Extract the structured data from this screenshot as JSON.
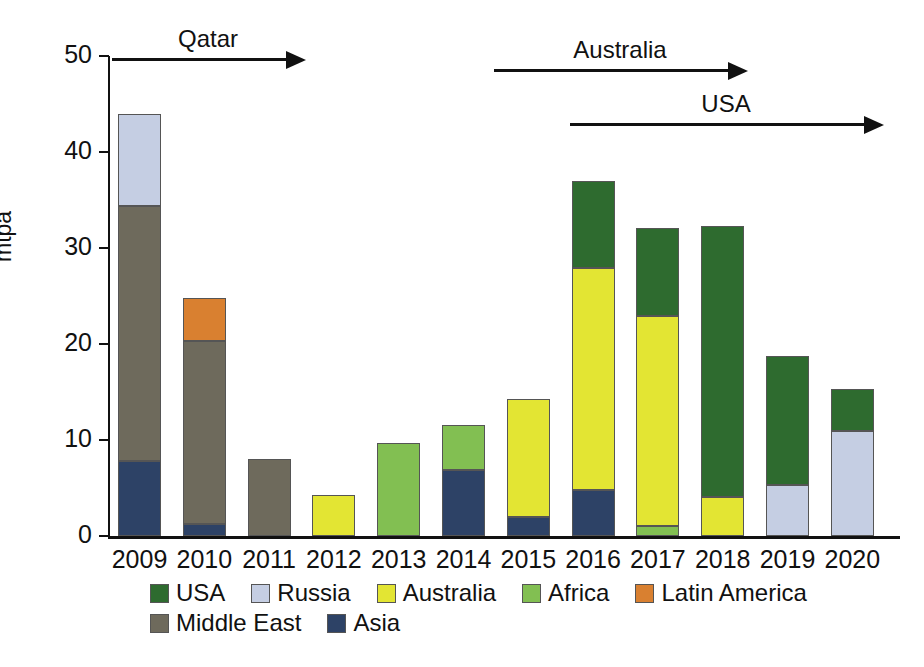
{
  "chart_data": {
    "type": "bar",
    "stacked": true,
    "title": "",
    "xlabel": "",
    "ylabel": "mtpa",
    "ylim": [
      0,
      50
    ],
    "yticks": [
      0,
      10,
      20,
      30,
      40,
      50
    ],
    "grid": false,
    "legend_position": "bottom",
    "categories": [
      "2009",
      "2010",
      "2011",
      "2012",
      "2013",
      "2014",
      "2015",
      "2016",
      "2017",
      "2018",
      "2019",
      "2020"
    ],
    "series": [
      {
        "name": "USA",
        "color": "#2e6b2f",
        "values": [
          0,
          0,
          0,
          0,
          0,
          0,
          0,
          9.1,
          9.2,
          28.2,
          13.4,
          4.4
        ]
      },
      {
        "name": "Russia",
        "color": "#c5cee3",
        "values": [
          9.6,
          0,
          0,
          0,
          0,
          0,
          0,
          0,
          0,
          0,
          5.3,
          10.9
        ]
      },
      {
        "name": "Australia",
        "color": "#e3e533",
        "values": [
          0,
          0,
          0,
          4.3,
          0,
          0,
          12.3,
          23.1,
          21.9,
          4.1,
          0,
          0
        ]
      },
      {
        "name": "Africa",
        "color": "#82bf52",
        "values": [
          0,
          0,
          0,
          0,
          9.7,
          4.7,
          0,
          0,
          1.0,
          0,
          0,
          0
        ]
      },
      {
        "name": "Latin America",
        "color": "#d98030",
        "values": [
          0,
          4.5,
          0,
          0,
          0,
          0,
          0,
          0,
          0,
          0,
          0,
          0
        ]
      },
      {
        "name": "Middle East",
        "color": "#6e6a5c",
        "values": [
          26.6,
          19.0,
          8.0,
          0,
          0,
          0,
          0,
          0,
          0,
          0,
          0,
          0
        ]
      },
      {
        "name": "Asia",
        "color": "#2d4266",
        "values": [
          7.8,
          1.3,
          0,
          0,
          0,
          6.9,
          2.0,
          4.8,
          0,
          0,
          0,
          0
        ]
      }
    ],
    "stack_order": [
      "Asia",
      "Middle East",
      "Latin America",
      "Africa",
      "Australia",
      "Russia",
      "USA"
    ],
    "totals": [
      44.0,
      24.8,
      8.0,
      4.3,
      9.7,
      11.6,
      14.3,
      37.0,
      32.1,
      32.3,
      18.7,
      15.3
    ],
    "annotations": [
      {
        "label": "Qatar",
        "from_category": "2009",
        "to_category": "2012",
        "row": 0
      },
      {
        "label": "Australia",
        "from_category": "2015",
        "to_category": "2018",
        "row": 1
      },
      {
        "label": "USA",
        "from_category": "2016",
        "to_category": "2020",
        "row": 2
      }
    ]
  },
  "legend": {
    "rows": [
      [
        {
          "label": "USA",
          "color": "#2e6b2f"
        },
        {
          "label": "Russia",
          "color": "#c5cee3"
        },
        {
          "label": "Australia",
          "color": "#e3e533"
        },
        {
          "label": "Africa",
          "color": "#82bf52"
        },
        {
          "label": "Latin America",
          "color": "#d98030"
        }
      ],
      [
        {
          "label": "Middle East",
          "color": "#6e6a5c"
        },
        {
          "label": "Asia",
          "color": "#2d4266"
        }
      ]
    ]
  },
  "annotation_geometry": [
    {
      "label": "Qatar",
      "left": 112,
      "width": 192,
      "top": 58
    },
    {
      "label": "Australia",
      "left": 494,
      "width": 252,
      "top": 69
    },
    {
      "label": "USA",
      "left": 570,
      "width": 312,
      "top": 123
    }
  ]
}
